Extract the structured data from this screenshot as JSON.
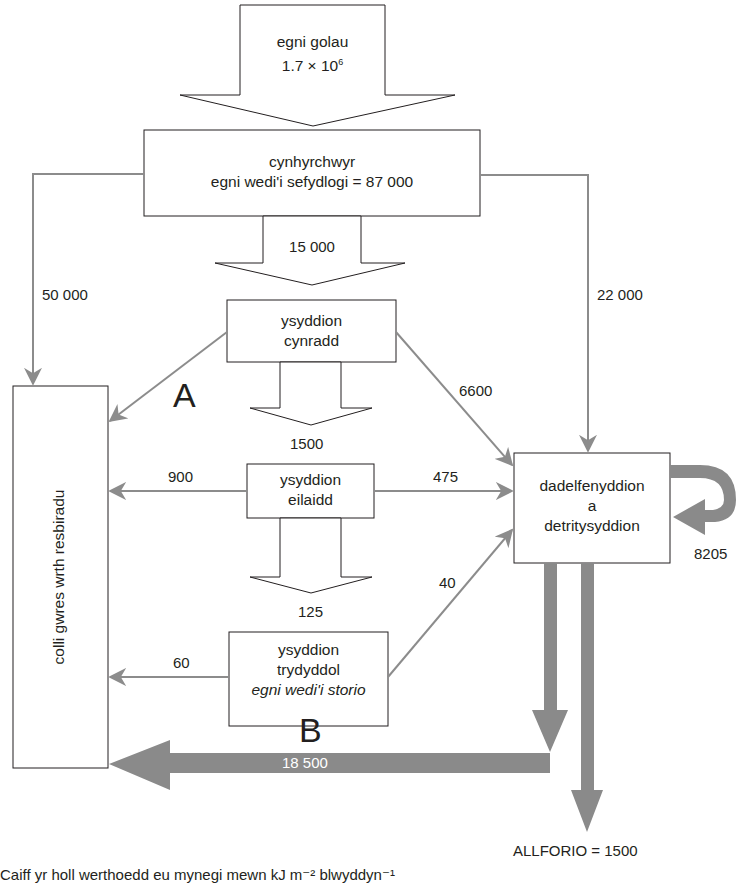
{
  "diagram": {
    "colors": {
      "line": "#231f20",
      "thin_arrow": "#8c8c8c",
      "thick_arrow": "#8a8a8a",
      "background": "#ffffff"
    },
    "nodes": {
      "light": {
        "line1": "egni golau",
        "line2": "1.7 × 10",
        "exp": "6"
      },
      "producers": {
        "line1": "cynhyrchwyr",
        "line2": "egni wedi'i sefydlogi = 87 000"
      },
      "primary": {
        "line1": "ysyddion",
        "line2": "cynradd"
      },
      "secondary": {
        "line1": "ysyddion",
        "line2": "eilaidd"
      },
      "tertiary": {
        "line1": "ysyddion",
        "line2": "trydyddol",
        "line3": "egni wedi'i storio"
      },
      "decomposers": {
        "line1": "dadelfenyddion",
        "line2": "a",
        "line3": "detritysyddion"
      },
      "respiration": {
        "label": "colli gwres wrth resbiradu"
      }
    },
    "flows": {
      "producers_to_primary": "15 000",
      "producers_to_respiration": "50 000",
      "producers_to_decomposers": "22 000",
      "primary_to_secondary": "1500",
      "primary_to_decomposers": "6600",
      "secondary_to_respiration": "900",
      "secondary_to_decomposers": "475",
      "secondary_to_tertiary": "125",
      "tertiary_to_respiration": "60",
      "tertiary_to_decomposers": "40",
      "decomposers_recycle": "8205",
      "decomposers_to_respiration": "18 500",
      "export": "ALLFORIO = 1500"
    },
    "markers": {
      "a": "A",
      "b": "B"
    },
    "footer": "Caiff yr holl werthoedd eu mynegi mewn kJ m⁻² blwyddyn⁻¹"
  }
}
